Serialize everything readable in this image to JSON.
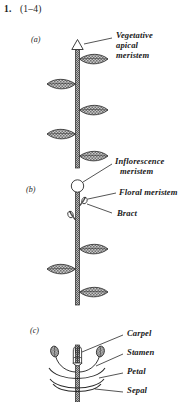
{
  "figure": {
    "question_number": "1.",
    "question_range": "(1–4)",
    "panels": [
      {
        "id": "a",
        "label": "(a)",
        "description": "vegetative shoot with apical meristem and alternating leaves",
        "callouts": [
          {
            "name": "vegetative-apical-meristem",
            "lines": [
              "Vegetative",
              "apical",
              "meristem"
            ]
          }
        ]
      },
      {
        "id": "b",
        "label": "(b)",
        "description": "inflorescence shoot with floral meristems and bracts",
        "callouts": [
          {
            "name": "inflorescence-meristem",
            "lines": [
              "Inflorescence",
              "meristem"
            ]
          },
          {
            "name": "floral-meristem",
            "lines": [
              "Floral meristem"
            ]
          },
          {
            "name": "bract",
            "lines": [
              "Bract"
            ]
          }
        ]
      },
      {
        "id": "c",
        "label": "(c)",
        "description": "floral meristem with four whorls of organs",
        "callouts": [
          {
            "name": "carpel",
            "lines": [
              "Carpel"
            ]
          },
          {
            "name": "stamen",
            "lines": [
              "Stamen"
            ]
          },
          {
            "name": "petal",
            "lines": [
              "Petal"
            ]
          },
          {
            "name": "sepal",
            "lines": [
              "Sepal"
            ]
          }
        ]
      }
    ],
    "labels": {
      "vegetative_apical_meristem_l1": "Vegetative",
      "vegetative_apical_meristem_l2": "apical",
      "vegetative_apical_meristem_l3": "meristem",
      "inflorescence_meristem_l1": "Inflorescence",
      "inflorescence_meristem_l2": "meristem",
      "floral_meristem": "Floral meristem",
      "bract": "Bract",
      "carpel": "Carpel",
      "stamen": "Stamen",
      "petal": "Petal",
      "sepal": "Sepal",
      "panel_a": "(a)",
      "panel_b": "(b)",
      "panel_c": "(c)"
    },
    "colors": {
      "ink": "#1a1a1a",
      "stem_fill": "#7a7a7a",
      "leaf_fill": "#9a9a9a",
      "leaf_stroke": "#2a2a2a",
      "background": "#ffffff"
    }
  }
}
